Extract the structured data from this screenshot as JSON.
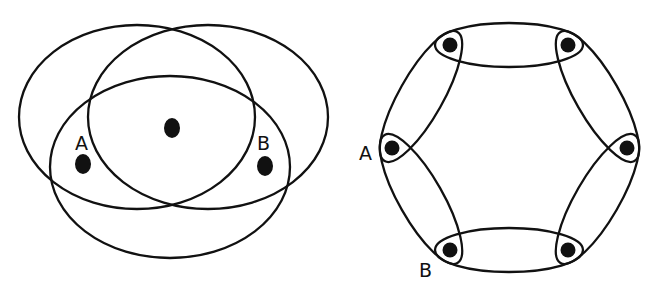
{
  "colors": {
    "stroke": "#111111",
    "background": "#ffffff"
  },
  "left_diagram": {
    "description": "Three overlapping ellipses (hyperedges) over three vertices",
    "ellipses": [
      {
        "cx": 137,
        "cy": 117,
        "rx": 118,
        "ry": 92
      },
      {
        "cx": 208,
        "cy": 117,
        "rx": 120,
        "ry": 92
      },
      {
        "cx": 170,
        "cy": 167,
        "rx": 120,
        "ry": 91
      }
    ],
    "vertices": [
      {
        "cx": 172,
        "cy": 128,
        "label": ""
      },
      {
        "cx": 83,
        "cy": 164,
        "label": "A"
      },
      {
        "cx": 265,
        "cy": 166,
        "label": "B"
      }
    ],
    "labels": {
      "a": {
        "text": "A",
        "x": 75,
        "y": 150
      },
      "b": {
        "text": "B",
        "x": 257,
        "y": 150
      }
    }
  },
  "right_diagram": {
    "description": "Hexagonal cycle of six elliptical hyperedges, each vertex enclosed by two edges",
    "vertices": [
      {
        "cx": 450,
        "cy": 45
      },
      {
        "cx": 568,
        "cy": 45
      },
      {
        "cx": 627,
        "cy": 148
      },
      {
        "cx": 568,
        "cy": 250
      },
      {
        "cx": 450,
        "cy": 250
      },
      {
        "cx": 392,
        "cy": 148
      }
    ],
    "labels": {
      "a": {
        "text": "A",
        "x": 359,
        "y": 160
      },
      "b": {
        "text": "B",
        "x": 419,
        "y": 277
      }
    }
  }
}
